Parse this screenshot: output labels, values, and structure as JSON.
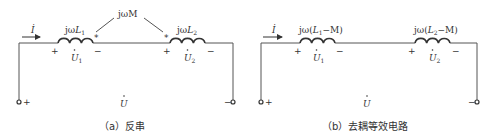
{
  "circuit_a": {
    "current_label": "İ",
    "mutual_label": "jωM",
    "coil1": {
      "label_prefix": "jω",
      "label_var": "L",
      "label_sub": "1",
      "voltage_var": "U",
      "voltage_sub": "1",
      "plus": "+",
      "minus": "−",
      "dot": "*"
    },
    "coil2": {
      "label_prefix": "jω",
      "label_var": "L",
      "label_sub": "2",
      "voltage_var": "U",
      "voltage_sub": "2",
      "plus": "+",
      "minus": "−",
      "dot": "*"
    },
    "terminal_plus": "+",
    "terminal_minus": "−",
    "total_voltage": "U",
    "caption": "（a）反串"
  },
  "circuit_b": {
    "current_label": "İ",
    "coil1": {
      "label_prefix": "jω(",
      "label_var": "L",
      "label_sub": "1",
      "label_suffix": "−M)",
      "voltage_var": "U",
      "voltage_sub": "1",
      "plus": "+",
      "minus": "−"
    },
    "coil2": {
      "label_prefix": "jω(",
      "label_var": "L",
      "label_sub": "2",
      "label_suffix": "−M)",
      "voltage_var": "U",
      "voltage_sub": "2",
      "plus": "+",
      "minus": "−"
    },
    "terminal_plus": "+",
    "terminal_minus": "−",
    "total_voltage": "U",
    "caption": "（b）去耦等效电路"
  }
}
